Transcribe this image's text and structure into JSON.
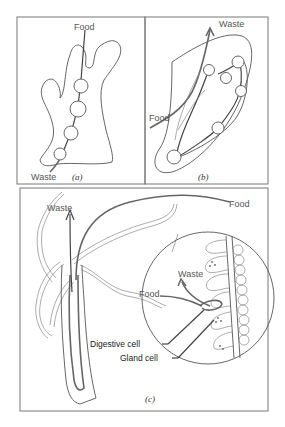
{
  "figure": {
    "panels": [
      {
        "id": "a",
        "label": "(a)",
        "labels": {
          "food": "Food",
          "waste": "Waste"
        }
      },
      {
        "id": "b",
        "label": "(b)",
        "labels": {
          "food": "Food",
          "waste": "Waste"
        }
      },
      {
        "id": "c",
        "label": "(c)",
        "labels": {
          "food_top": "Food",
          "waste_top": "Waste",
          "food_inset": "Food",
          "waste_inset": "Waste",
          "digestive_cell": "Digestive cell",
          "gland_cell": "Gland cell"
        }
      }
    ],
    "colors": {
      "line": "#555555",
      "frame": "#777777",
      "text": "#555555",
      "background": "#ffffff"
    }
  }
}
